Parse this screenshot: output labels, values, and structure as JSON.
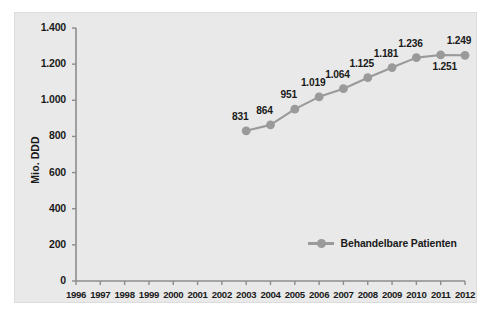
{
  "chart_data": {
    "type": "line",
    "title": "",
    "xlabel": "",
    "ylabel": "Mio. DDD",
    "xlim": [
      1996,
      2012
    ],
    "ylim": [
      0,
      1400
    ],
    "grid": false,
    "legend_position": "inside-bottom-center",
    "x_tick_labels": [
      "1996",
      "1997",
      "1998",
      "1999",
      "2000",
      "2001",
      "2002",
      "2003",
      "2004",
      "2005",
      "2006",
      "2007",
      "2008",
      "2009",
      "2010",
      "2011",
      "2012"
    ],
    "y_tick_labels": [
      "0",
      "200",
      "400",
      "600",
      "800",
      "1.000",
      "1.200",
      "1.400"
    ],
    "y_tick_values": [
      0,
      200,
      400,
      600,
      800,
      1000,
      1200,
      1400
    ],
    "series": [
      {
        "name": "Behandelbare Patienten",
        "color": "#9a9a9a",
        "x": [
          2003,
          2004,
          2005,
          2006,
          2007,
          2008,
          2009,
          2010,
          2011,
          2012
        ],
        "values": [
          831,
          864,
          951,
          1019,
          1064,
          1125,
          1181,
          1236,
          1251,
          1249
        ],
        "data_labels": [
          "831",
          "864",
          "951",
          "1.019",
          "1.064",
          "1.125",
          "1.181",
          "1.236",
          "1.251",
          "1.249"
        ],
        "label_positions": [
          "above",
          "above",
          "above",
          "above",
          "above",
          "above",
          "above",
          "above",
          "below",
          "above"
        ]
      }
    ]
  },
  "legend": {
    "entries": [
      {
        "label": "Behandelbare Patienten"
      }
    ]
  },
  "colors": {
    "series": "#9a9a9a",
    "panel_background": "#e9e9e9",
    "axis": "#8c8c8c",
    "text": "#1a1a1a"
  }
}
